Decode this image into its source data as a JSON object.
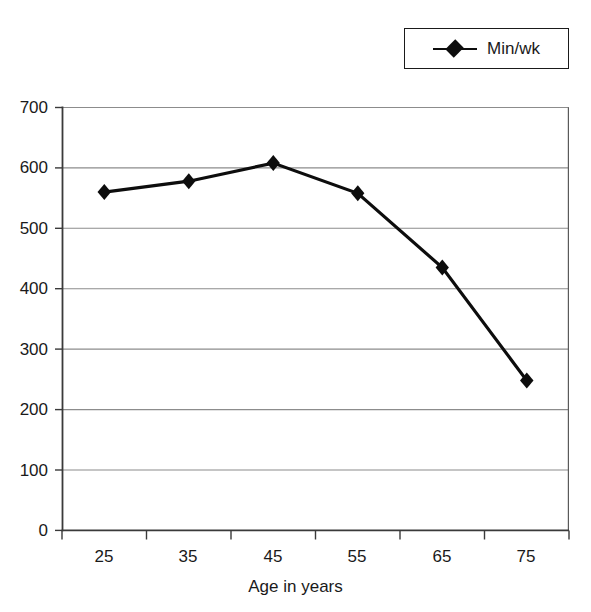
{
  "legend": {
    "position": "top-right",
    "entries": [
      {
        "label": "Min/wk",
        "marker": "diamond",
        "color": "#0d0d0d"
      }
    ]
  },
  "chart_data": {
    "type": "line",
    "title": "",
    "subtitle": "",
    "xlabel": "Age in years",
    "ylabel": "",
    "categories": [
      "25",
      "35",
      "45",
      "55",
      "65",
      "75"
    ],
    "x": [
      25,
      35,
      45,
      55,
      65,
      75
    ],
    "series": [
      {
        "name": "Min/wk",
        "values": [
          560,
          578,
          608,
          558,
          435,
          248
        ],
        "color": "#0d0d0d",
        "marker": "diamond"
      }
    ],
    "ylim": [
      0,
      700
    ],
    "yticks": [
      0,
      100,
      200,
      300,
      400,
      500,
      600,
      700
    ],
    "ytick_labels": [
      "0",
      "100",
      "200",
      "300",
      "400",
      "500",
      "600",
      "700"
    ],
    "xtick_labels": [
      "25",
      "35",
      "45",
      "55",
      "65",
      "75"
    ],
    "grid": "horizontal",
    "grid_color": "#8c8c8c",
    "axis_color": "#3a3a3a",
    "plot_background": "#ffffff",
    "legend_position": "top-right",
    "legend_entries": [
      "Min/wk"
    ]
  }
}
